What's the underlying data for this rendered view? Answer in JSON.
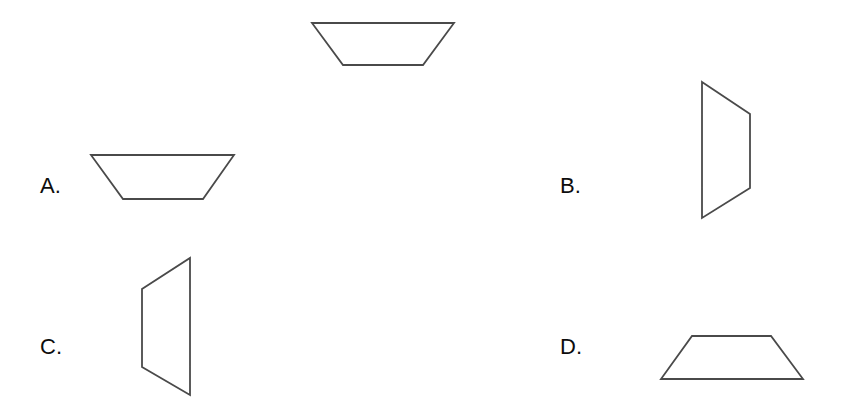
{
  "page": {
    "background_color": "#ffffff",
    "width": 845,
    "height": 415,
    "kind": "geometry-multiple-choice-shape-matching"
  },
  "stroke": {
    "color": "#4a4a4a",
    "width": 1.8,
    "fill": "none"
  },
  "prompt_shape": {
    "name": "reference-trapezoid",
    "description": "isosceles trapezoid with the longer parallel side on top",
    "points": "312,23 454,23 423,65 343,65"
  },
  "options": [
    {
      "id": "a",
      "label": "A.",
      "shape_name": "inverted-trapezoid",
      "description": "isosceles trapezoid with the longer parallel side on top",
      "points": "91,155 234,155 203,199 123,199"
    },
    {
      "id": "b",
      "label": "B.",
      "shape_name": "right-slanted-quadrilateral",
      "description": "trapezoid rotated so the vertical long side is on the left",
      "points": "702,82 750,114 750,188 702,218"
    },
    {
      "id": "c",
      "label": "C.",
      "shape_name": "left-slanted-quadrilateral",
      "description": "trapezoid rotated so the vertical long side is on the right",
      "points": "190,258 190,395 142,367 142,289"
    },
    {
      "id": "d",
      "label": "D.",
      "shape_name": "upright-trapezoid",
      "description": "isosceles trapezoid with the longer parallel side on the bottom",
      "points": "692,336 771,336 803,379 661,379"
    }
  ]
}
